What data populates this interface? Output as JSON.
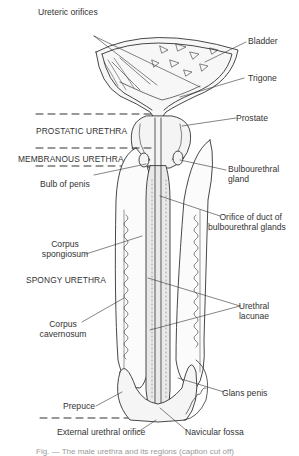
{
  "figure": {
    "ink_color": "#333333",
    "fill_color": "#ececec",
    "labels": {
      "ureteric_orifices": "Ureteric orifices",
      "bladder": "Bladder",
      "trigone": "Trigone",
      "prostate": "Prostate",
      "bulbourethral_gland_1": "Bulbourethral",
      "bulbourethral_gland_2": "gland",
      "bulb_of_penis": "Bulb of penis",
      "orifice_duct_1": "Orifice of duct of",
      "orifice_duct_2": "bulbourethral glands",
      "corpus_spongiosum_1": "Corpus",
      "corpus_spongiosum_2": "spongiosum",
      "urethral_lacunae_1": "Urethral",
      "urethral_lacunae_2": "lacunae",
      "corpus_cavernosum_1": "Corpus",
      "corpus_cavernosum_2": "cavernosum",
      "glans_penis": "Glans penis",
      "prepuce": "Prepuce",
      "external_urethral_orifice": "External urethral orifice",
      "navicular_fossa": "Navicular fossa"
    },
    "regions": {
      "prostatic": "PROSTATIC URETHRA",
      "membranous": "MEMBRANOUS URETHRA",
      "spongy": "SPONGY URETHRA"
    },
    "signature": "Dennis"
  },
  "caption": {
    "text": "Fig. — The male urethra and its regions (caption cut off)"
  }
}
